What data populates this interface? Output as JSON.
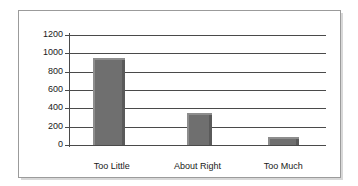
{
  "chart_data": {
    "type": "bar",
    "title": "",
    "xlabel": "",
    "ylabel": "",
    "categories": [
      "Too Little",
      "About Right",
      "Too Much"
    ],
    "values": [
      950,
      345,
      85
    ],
    "ylim": [
      0,
      1200
    ],
    "yticks": [
      0,
      200,
      400,
      600,
      800,
      1000,
      1200
    ],
    "ytick_labels": [
      "0",
      "200",
      "400",
      "600",
      "800",
      "1000",
      "1200"
    ],
    "grid": true,
    "legend": false,
    "series": [
      {
        "name": "",
        "values": [
          950,
          345,
          85
        ],
        "color": "#6f6f6f"
      }
    ],
    "colors": {
      "bar_fill": "#6f6f6f",
      "bar_highlight": "#8d8d8d",
      "bar_shadow": "#5a5a5a",
      "gridline": "#4a4a4a",
      "axis": "#4a4a4a",
      "frame_border": "#9b9b9b",
      "background": "#ffffff",
      "text": "#1a1a1a"
    }
  }
}
